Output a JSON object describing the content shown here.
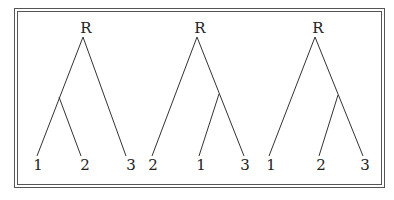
{
  "figure": {
    "type": "rooted-binary-trees",
    "trees": [
      {
        "root_label": "R",
        "leaves": [
          "1",
          "2",
          "3"
        ],
        "grouping": "((1,2),3)"
      },
      {
        "root_label": "R",
        "leaves": [
          "2",
          "1",
          "3"
        ],
        "grouping": "(2,(1,3))"
      },
      {
        "root_label": "R",
        "leaves": [
          "1",
          "2",
          "3"
        ],
        "grouping": "(1,(2,3))"
      }
    ]
  }
}
